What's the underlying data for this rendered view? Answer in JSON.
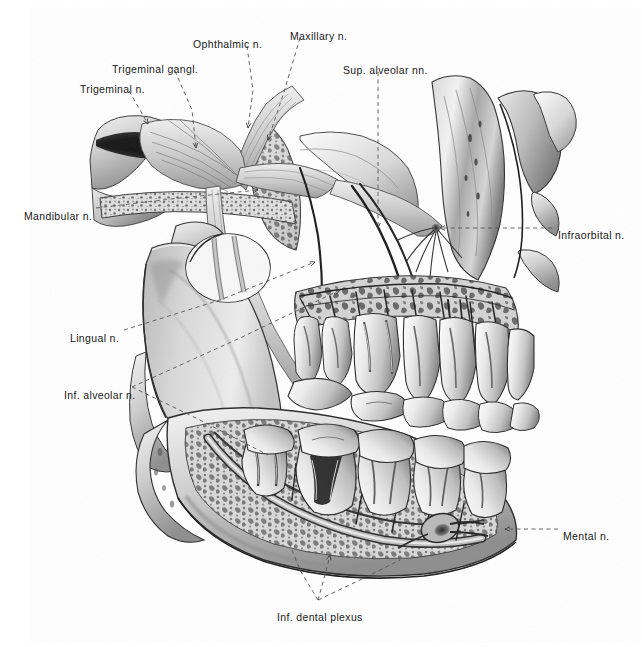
{
  "figure": {
    "style": "grayscale pencil and airbrush anatomical illustration",
    "background_color": "#ffffff",
    "ink_color": "#1a1a1a",
    "leader_line_color": "#555555",
    "leader_line_style": "dashed",
    "canvas": {
      "width": 642,
      "height": 647
    }
  },
  "labels": [
    {
      "id": "ophthalmic-n",
      "text": "Ophthalmic n.",
      "x": 193,
      "y": 39,
      "align": "left",
      "leader": [
        [
          247,
          46
        ],
        [
          253,
          90
        ],
        [
          248,
          128
        ]
      ],
      "target": [
        248,
        128
      ]
    },
    {
      "id": "maxillary-n",
      "text": "Maxillary n.",
      "x": 290,
      "y": 31,
      "align": "left",
      "leader": [
        [
          300,
          38
        ],
        [
          284,
          92
        ],
        [
          268,
          140
        ]
      ],
      "target": [
        268,
        140
      ]
    },
    {
      "id": "sup-alveolar-nn",
      "text": "Sup. alveolar nn.",
      "x": 343,
      "y": 65,
      "align": "left",
      "leader": [
        [
          378,
          72
        ],
        [
          378,
          150
        ],
        [
          378,
          228
        ]
      ],
      "target": [
        378,
        228
      ]
    },
    {
      "id": "trigeminal-gangl",
      "text": "Trigeminal gangl.",
      "x": 112,
      "y": 64,
      "align": "left",
      "leader": [
        [
          175,
          71
        ],
        [
          192,
          110
        ],
        [
          196,
          148
        ]
      ],
      "target": [
        196,
        148
      ]
    },
    {
      "id": "trigeminal-n",
      "text": "Trigeminal n.",
      "x": 80,
      "y": 84,
      "align": "left",
      "leader": [
        [
          129,
          91
        ],
        [
          140,
          110
        ],
        [
          148,
          124
        ]
      ],
      "target": [
        148,
        124
      ]
    },
    {
      "id": "mandibular-n",
      "text": "Mandibular n.",
      "x": 24,
      "y": 211,
      "align": "left",
      "leader": [
        [
          96,
          208
        ],
        [
          180,
          198
        ],
        [
          258,
          190
        ]
      ],
      "target": [
        258,
        190
      ]
    },
    {
      "id": "infraorbital-n",
      "text": "Infraorbital n.",
      "x": 558,
      "y": 230,
      "align": "left",
      "leader": [
        [
          552,
          228
        ],
        [
          495,
          228
        ],
        [
          440,
          228
        ]
      ],
      "target": [
        440,
        228
      ]
    },
    {
      "id": "lingual-n",
      "text": "Lingual n.",
      "x": 70,
      "y": 333,
      "align": "left",
      "leader": [
        [
          124,
          330
        ],
        [
          220,
          300
        ],
        [
          315,
          262
        ]
      ],
      "target": [
        315,
        262
      ]
    },
    {
      "id": "inf-alveolar-n",
      "text": "Inf. alveolar n.",
      "x": 64,
      "y": 390,
      "align": "left",
      "leader": [
        [
          132,
          387
        ],
        [
          240,
          338
        ],
        [
          340,
          290
        ]
      ],
      "target": [
        340,
        290
      ]
    },
    {
      "id": "mental-n",
      "text": "Mental n.",
      "x": 563,
      "y": 531,
      "align": "left",
      "leader": [
        [
          558,
          529
        ],
        [
          530,
          529
        ],
        [
          505,
          529
        ]
      ],
      "target": [
        505,
        529
      ]
    },
    {
      "id": "inf-dental-plexus",
      "text": "Inf. dental plexus",
      "x": 277,
      "y": 612,
      "align": "left",
      "leader": [
        [
          318,
          600
        ],
        [
          325,
          575
        ],
        [
          330,
          555
        ]
      ],
      "target": [
        330,
        555
      ]
    }
  ],
  "leader_extras": [
    {
      "id": "inf-dental-plexus-branch-a",
      "points": [
        [
          318,
          600
        ],
        [
          300,
          570
        ],
        [
          288,
          540
        ]
      ]
    },
    {
      "id": "inf-dental-plexus-branch-b",
      "points": [
        [
          318,
          600
        ],
        [
          360,
          580
        ],
        [
          400,
          560
        ]
      ]
    },
    {
      "id": "inf-alveolar-lower-branch",
      "points": [
        [
          132,
          387
        ],
        [
          200,
          420
        ],
        [
          268,
          455
        ]
      ]
    }
  ],
  "structures": [
    {
      "id": "cranial-base",
      "name": "Cranial base / middle fossa floor"
    },
    {
      "id": "trigeminal-ganglion",
      "name": "Trigeminal ganglion"
    },
    {
      "id": "mandibular-ramus",
      "name": "Mandibular ramus"
    },
    {
      "id": "mandibular-condyle",
      "name": "Mandibular condyle"
    },
    {
      "id": "maxilla",
      "name": "Maxilla with trabecular bone"
    },
    {
      "id": "zygomatic-arch",
      "name": "Zygomatic process"
    },
    {
      "id": "maxillary-teeth",
      "name": "Upper (maxillary) teeth"
    },
    {
      "id": "mandibular-teeth",
      "name": "Lower (mandibular) teeth"
    },
    {
      "id": "mandibular-canal",
      "name": "Mandibular canal"
    },
    {
      "id": "mental-foramen",
      "name": "Mental foramen"
    }
  ]
}
